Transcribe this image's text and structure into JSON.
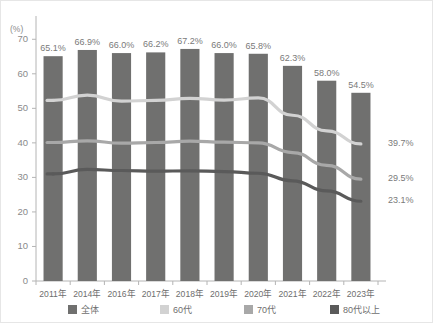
{
  "chart_data": {
    "type": "bar",
    "title": "",
    "xlabel": "",
    "ylabel": "(%)",
    "unit_label": "(%)",
    "ylim": [
      0,
      75
    ],
    "yticks": [
      0,
      10,
      20,
      30,
      40,
      50,
      60,
      70
    ],
    "grid": false,
    "legend_position": "bottom",
    "categories": [
      "2011年",
      "2014年",
      "2016年",
      "2017年",
      "2018年",
      "2019年",
      "2020年",
      "2021年",
      "2022年",
      "2023年"
    ],
    "series": [
      {
        "name": "全体",
        "type": "bar",
        "color": "#70706f",
        "values": [
          65.1,
          66.9,
          66.0,
          66.2,
          67.2,
          66.0,
          65.8,
          62.3,
          58.0,
          54.5
        ],
        "labels": [
          "65.1%",
          "66.9%",
          "66.0%",
          "66.2%",
          "67.2%",
          "66.0%",
          "65.8%",
          "62.3%",
          "58.0%",
          "54.5%"
        ]
      },
      {
        "name": "60代",
        "type": "line",
        "color": "#d2d2d2",
        "values": [
          52.3,
          53.8,
          52.1,
          52.3,
          52.9,
          52.4,
          53.0,
          48.0,
          43.5,
          39.7
        ],
        "end_label": "39.7%"
      },
      {
        "name": "70代",
        "type": "line",
        "color": "#a8a8a8",
        "values": [
          40.1,
          40.6,
          39.9,
          40.1,
          40.5,
          40.2,
          40.0,
          37.2,
          33.5,
          29.5
        ],
        "end_label": "29.5%"
      },
      {
        "name": "80代以上",
        "type": "line",
        "color": "#5a5a5a",
        "values": [
          31.0,
          32.3,
          32.0,
          31.8,
          31.9,
          31.7,
          31.2,
          29.0,
          26.1,
          23.1
        ],
        "end_label": "23.1%"
      }
    ]
  },
  "legend": {
    "items": [
      {
        "label": "全体",
        "color": "#70706f"
      },
      {
        "label": "60代",
        "color": "#d2d2d2"
      },
      {
        "label": "70代",
        "color": "#a8a8a8"
      },
      {
        "label": "80代以上",
        "color": "#5a5a5a"
      }
    ]
  }
}
